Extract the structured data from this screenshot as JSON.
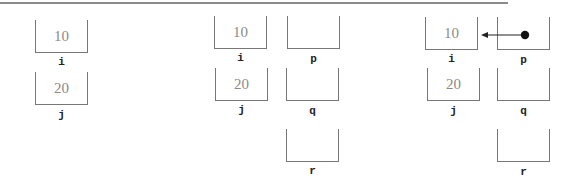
{
  "diagram": {
    "type": "memory-state-diagram",
    "panels": [
      {
        "id": "panel1",
        "variables": [
          {
            "name": "i",
            "value": "10",
            "x": 35,
            "y": 20
          },
          {
            "name": "j",
            "value": "20",
            "x": 35,
            "y": 72
          }
        ]
      },
      {
        "id": "panel2",
        "variables": [
          {
            "name": "i",
            "value": "10",
            "x": 214,
            "y": 16
          },
          {
            "name": "j",
            "value": "20",
            "x": 215,
            "y": 68
          },
          {
            "name": "p",
            "value": "",
            "x": 287,
            "y": 16
          },
          {
            "name": "q",
            "value": "",
            "x": 286,
            "y": 68
          },
          {
            "name": "r",
            "value": "",
            "x": 286,
            "y": 129
          }
        ]
      },
      {
        "id": "panel3",
        "variables": [
          {
            "name": "i",
            "value": "10",
            "x": 425,
            "y": 17
          },
          {
            "name": "j",
            "value": "20",
            "x": 427,
            "y": 68
          },
          {
            "name": "p",
            "value": "",
            "x": 497,
            "y": 17
          },
          {
            "name": "q",
            "value": "",
            "x": 497,
            "y": 68
          },
          {
            "name": "r",
            "value": "",
            "x": 497,
            "y": 129
          }
        ],
        "pointers": [
          {
            "from": "p",
            "to": "i"
          }
        ]
      }
    ]
  }
}
